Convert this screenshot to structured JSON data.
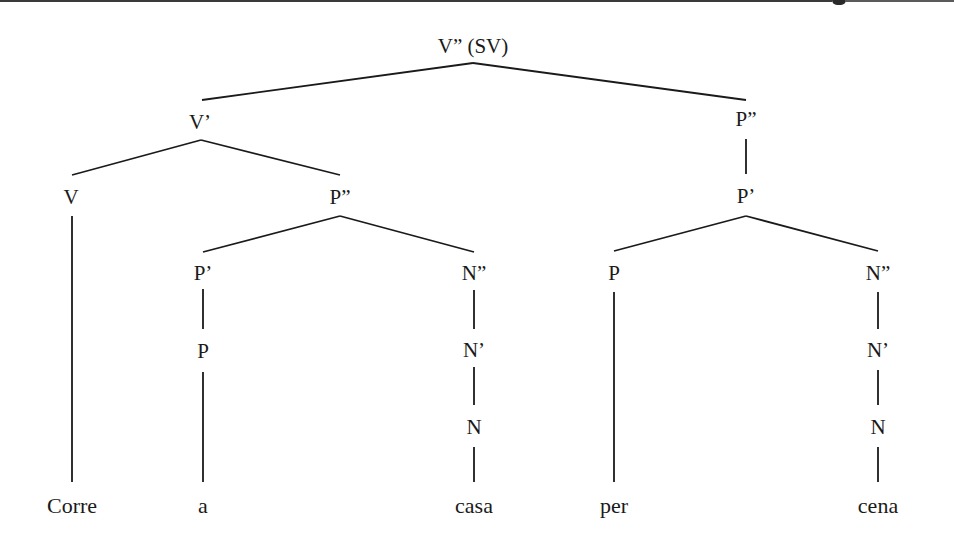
{
  "diagram": {
    "type": "syntax-tree",
    "root": "V” (SV)",
    "nodes": {
      "root": {
        "label": "V” (SV)",
        "x": 473,
        "y": 46
      },
      "v_bar": {
        "label": "V’",
        "x": 200,
        "y": 122
      },
      "p2_right": {
        "label": "P”",
        "x": 746,
        "y": 119
      },
      "v": {
        "label": "V",
        "x": 71,
        "y": 197
      },
      "p2_mid": {
        "label": "P”",
        "x": 340,
        "y": 197
      },
      "p_bar_right": {
        "label": "P’",
        "x": 746,
        "y": 196
      },
      "p_bar_mid": {
        "label": "P’",
        "x": 203,
        "y": 273
      },
      "n2_mid": {
        "label": "N”",
        "x": 474,
        "y": 273
      },
      "p_right": {
        "label": "P",
        "x": 614,
        "y": 273
      },
      "n2_right": {
        "label": "N”",
        "x": 878,
        "y": 273
      },
      "p_mid": {
        "label": "P",
        "x": 203,
        "y": 351
      },
      "n_bar_mid": {
        "label": "N’",
        "x": 474,
        "y": 350
      },
      "n_bar_right": {
        "label": "N’",
        "x": 878,
        "y": 350
      },
      "n_mid": {
        "label": "N",
        "x": 474,
        "y": 427
      },
      "n_right": {
        "label": "N",
        "x": 878,
        "y": 427
      }
    },
    "leaves": [
      {
        "label": "Corre",
        "x": 72,
        "y": 506
      },
      {
        "label": "a",
        "x": 203,
        "y": 506
      },
      {
        "label": "casa",
        "x": 474,
        "y": 506
      },
      {
        "label": "per",
        "x": 614,
        "y": 506
      },
      {
        "label": "cena",
        "x": 878,
        "y": 506
      }
    ],
    "edges": [
      {
        "from": "V” (SV)",
        "to": "V’"
      },
      {
        "from": "V” (SV)",
        "to": "P”"
      },
      {
        "from": "V’",
        "to": "V"
      },
      {
        "from": "V’",
        "to": "P”"
      },
      {
        "from": "P”",
        "to": "P’"
      },
      {
        "from": "P”",
        "to": "P’"
      },
      {
        "from": "P”",
        "to": "N”"
      },
      {
        "from": "P’",
        "to": "P"
      },
      {
        "from": "P’",
        "to": "N”"
      },
      {
        "from": "P’",
        "to": "P"
      },
      {
        "from": "N”",
        "to": "N’"
      },
      {
        "from": "N’",
        "to": "N"
      },
      {
        "from": "V",
        "to": "Corre"
      },
      {
        "from": "P",
        "to": "a"
      },
      {
        "from": "N",
        "to": "casa"
      },
      {
        "from": "P",
        "to": "per"
      },
      {
        "from": "N",
        "to": "cena"
      }
    ],
    "colors": {
      "ink": "#1a1a1a",
      "paper": "#ffffff",
      "top_rule": "#3a3a3a"
    }
  }
}
